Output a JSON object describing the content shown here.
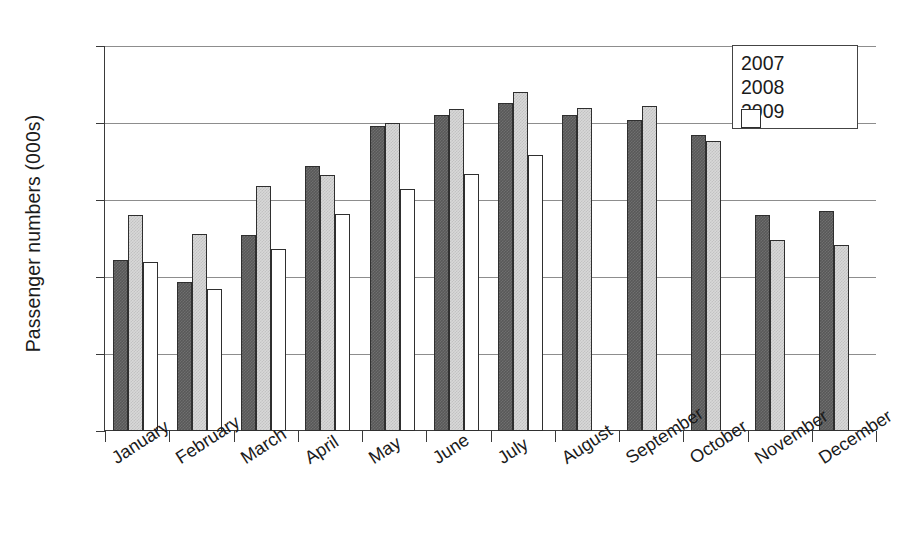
{
  "chart_data": {
    "type": "bar",
    "title": "",
    "xlabel": "",
    "ylabel": "Passenger numbers (000s)",
    "ylim": [
      0,
      250
    ],
    "yticks": [
      0,
      50,
      100,
      150,
      200,
      250
    ],
    "ytick_labels": [
      "0",
      "50",
      "100",
      "150",
      "200",
      "250"
    ],
    "grid": "horizontal",
    "legend_position": "top-right",
    "categories": [
      "January",
      "February",
      "March",
      "April",
      "May",
      "June",
      "July",
      "August",
      "September",
      "October",
      "November",
      "December"
    ],
    "series": [
      {
        "name": "2007",
        "color": "#585858",
        "values": [
          111,
          97,
          127,
          172,
          198,
          205,
          213,
          205,
          202,
          192,
          140,
          143
        ]
      },
      {
        "name": "2008",
        "color": "#d8d8d8",
        "values": [
          140,
          128,
          159,
          166,
          200,
          209,
          220,
          210,
          211,
          188,
          124,
          121
        ]
      },
      {
        "name": "2009",
        "color": "#ffffff",
        "values": [
          110,
          92,
          118,
          141,
          157,
          167,
          179,
          null,
          null,
          null,
          null,
          null
        ]
      }
    ]
  },
  "legend": {
    "items": [
      {
        "label": "2007",
        "swatch": "dark-gray-hatch"
      },
      {
        "label": "2008",
        "swatch": "light-gray-hatch"
      },
      {
        "label": "2009",
        "swatch": "white"
      }
    ]
  }
}
